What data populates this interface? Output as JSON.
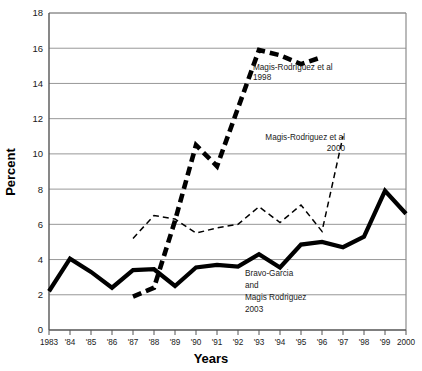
{
  "chart_data": {
    "type": "line",
    "title": "",
    "xlabel": "Years",
    "ylabel": "Percent",
    "grid": true,
    "legend_position": "inline-annotations",
    "xlim": [
      1983,
      2000
    ],
    "ylim": [
      0,
      18
    ],
    "ytick_step": 2,
    "x": [
      1983,
      1984,
      1985,
      1986,
      1987,
      1988,
      1989,
      1990,
      1991,
      1992,
      1993,
      1994,
      1995,
      1996,
      1997,
      1998,
      1999,
      2000
    ],
    "categories": [
      "1983",
      "'84",
      "'85",
      "'86",
      "'87",
      "'88",
      "'89",
      "'90",
      "'91",
      "'92",
      "'93",
      "'94",
      "'95",
      "'96",
      "'97",
      "'98",
      "'99",
      "2000"
    ],
    "ytick_labels": [
      "0",
      "2",
      "4",
      "6",
      "8",
      "10",
      "12",
      "14",
      "16",
      "18"
    ],
    "ytick_values": [
      0,
      2,
      4,
      6,
      8,
      10,
      12,
      14,
      16,
      18
    ],
    "series": [
      {
        "name": "Bravo-Garcia and Magis Rodriguez 2003",
        "style": "solid-thick",
        "color": "#000000",
        "x": [
          1983,
          1984,
          1985,
          1986,
          1987,
          1988,
          1989,
          1990,
          1991,
          1992,
          1993,
          1994,
          1995,
          1996,
          1997,
          1998,
          1999,
          2000
        ],
        "values": [
          2.2,
          4.05,
          3.3,
          2.4,
          3.4,
          3.45,
          2.5,
          3.55,
          3.7,
          3.6,
          4.3,
          3.55,
          4.85,
          5.0,
          4.7,
          5.3,
          7.9,
          6.6
        ]
      },
      {
        "name": "Magis-Rodriguez et al 1998",
        "style": "dashed-thick",
        "color": "#000000",
        "x": [
          1987,
          1988,
          1989,
          1990,
          1991,
          1992,
          1993,
          1994,
          1995,
          1996
        ],
        "values": [
          1.9,
          2.4,
          6.2,
          10.5,
          9.3,
          12.6,
          15.9,
          15.6,
          15.1,
          15.5
        ]
      },
      {
        "name": "Magis-Rodriguez et al 2000",
        "style": "dashed-thin",
        "color": "#000000",
        "x": [
          1987,
          1988,
          1989,
          1990,
          1991,
          1992,
          1993,
          1994,
          1995,
          1996,
          1997
        ],
        "values": [
          5.2,
          6.5,
          6.3,
          5.5,
          5.8,
          6.0,
          7.0,
          6.1,
          7.1,
          5.6,
          11.0
        ]
      }
    ],
    "annotations": [
      {
        "id": "annot-1998",
        "lines": [
          "Magis-Rodriguez et al",
          "1998"
        ],
        "align": "left"
      },
      {
        "id": "annot-2000",
        "lines": [
          "Magis-Rodriguez et al",
          "2000"
        ],
        "align": "right"
      },
      {
        "id": "annot-2003",
        "lines": [
          "Bravo-Garcia",
          "and",
          "Magis Rodriguez",
          "2003"
        ],
        "align": "left"
      }
    ]
  }
}
